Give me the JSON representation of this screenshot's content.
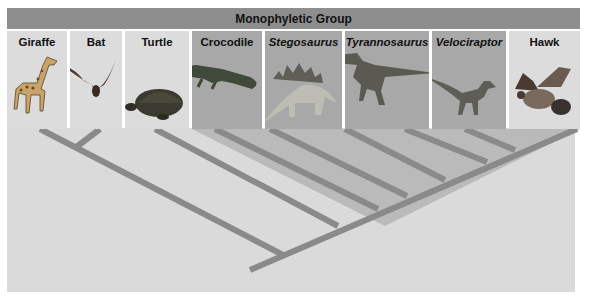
{
  "header": {
    "title": "Monophyletic Group"
  },
  "taxa": [
    {
      "label": "Giraffe",
      "italic": false,
      "in_group": false,
      "icon": "giraffe-icon"
    },
    {
      "label": "Bat",
      "italic": false,
      "in_group": false,
      "icon": "bat-icon"
    },
    {
      "label": "Turtle",
      "italic": false,
      "in_group": false,
      "icon": "turtle-icon"
    },
    {
      "label": "Crocodile",
      "italic": false,
      "in_group": true,
      "icon": "crocodile-icon"
    },
    {
      "label": "Stegosaurus",
      "italic": true,
      "in_group": true,
      "icon": "stegosaurus-icon"
    },
    {
      "label": "Tyrannosaurus",
      "italic": true,
      "in_group": true,
      "icon": "tyrannosaurus-icon"
    },
    {
      "label": "Velociraptor",
      "italic": true,
      "in_group": true,
      "icon": "velociraptor-icon"
    },
    {
      "label": "Hawk",
      "italic": false,
      "in_group": false,
      "icon": "hawk-icon"
    }
  ],
  "colors": {
    "header_bar": "#8e8e8e",
    "panel_out_group": "#dcdcdc",
    "panel_in_group": "#a8a8a8",
    "tree_background": "#dadada",
    "branch": "#8a8a8a",
    "monophyletic_shading": "#b4b4b4"
  }
}
